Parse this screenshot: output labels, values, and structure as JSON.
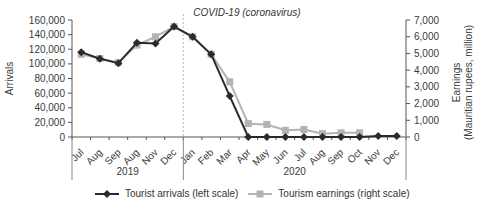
{
  "chart_data": {
    "type": "line",
    "title": "",
    "annotation": "COVID-19 (coronavirus)",
    "xlabel": "",
    "ylabel_left": "Arrivals",
    "ylabel_right": [
      "Earnings",
      "(Mauritian rupees, million)"
    ],
    "ylim_left": [
      0,
      160000
    ],
    "ylim_right": [
      0,
      7000
    ],
    "yticks_left": [
      "0",
      "20,000",
      "40,000",
      "60,000",
      "80,000",
      "100,000",
      "120,000",
      "140,000",
      "160,000"
    ],
    "yticks_right": [
      "0",
      "1,000",
      "2,000",
      "3,000",
      "4,000",
      "5,000",
      "6,000",
      "7,000"
    ],
    "categories": [
      "Jul",
      "Aug",
      "Sep",
      "Aug",
      "Nov",
      "Dec",
      "Jan",
      "Feb",
      "Mar",
      "Apr",
      "May",
      "Jun",
      "Jul",
      "Aug",
      "Sep",
      "Oct",
      "Nov",
      "Dec"
    ],
    "year_groups": [
      {
        "label": "2019",
        "start": 0,
        "end": 5
      },
      {
        "label": "2020",
        "start": 6,
        "end": 17
      }
    ],
    "series": [
      {
        "name": "Tourist arrivals (left scale)",
        "axis": "left",
        "color": "#2b2b2b",
        "marker": "diamond",
        "values": [
          116000,
          107000,
          101000,
          129000,
          128000,
          151000,
          137000,
          113000,
          56000,
          0,
          0,
          0,
          0,
          0,
          0,
          0,
          1500,
          1500
        ]
      },
      {
        "name": "Tourism earnings (right scale)",
        "axis": "right",
        "color": "#b3b3b3",
        "marker": "square",
        "values": [
          4950,
          4700,
          4450,
          5500,
          6000,
          6600,
          6000,
          4950,
          3300,
          800,
          750,
          400,
          450,
          200,
          250,
          250,
          null,
          null
        ]
      }
    ],
    "covid_marker_between": [
      "Dec 2019",
      "Jan 2020"
    ],
    "grid": false,
    "legend_position": "bottom"
  },
  "legend": {
    "arrivals_label": "Tourist arrivals (left scale)",
    "earnings_label": "Tourism earnings (right scale)"
  }
}
